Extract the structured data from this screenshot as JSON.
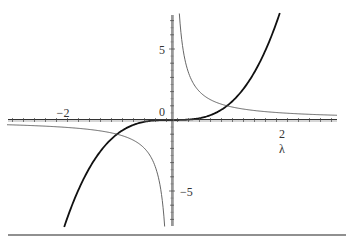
{
  "chart_data": {
    "type": "line",
    "title": "",
    "xlabel": "λ",
    "ylabel": "",
    "xlim": [
      -3.0,
      3.0
    ],
    "ylim": [
      -7.5,
      7.5
    ],
    "grid": false,
    "legend": null,
    "x_ticks": [
      {
        "value": -2,
        "label": "−2"
      },
      {
        "value": 2,
        "label": "2"
      }
    ],
    "y_ticks": [
      {
        "value": 5,
        "label": "5"
      },
      {
        "value": 0,
        "label": "0"
      },
      {
        "value": -5,
        "label": "−5"
      }
    ],
    "series": [
      {
        "name": "λ^3",
        "style": "thick",
        "color": "#111111",
        "x": [
          -1.96,
          -1.5,
          -1.0,
          -0.5,
          0,
          0.5,
          1.0,
          1.5,
          1.96
        ],
        "values": [
          -7.5,
          -3.375,
          -1.0,
          -0.125,
          0,
          0.125,
          1.0,
          3.375,
          7.5
        ]
      },
      {
        "name": "1/λ",
        "style": "thin",
        "color": "#555555",
        "x": [
          -3.0,
          -2.0,
          -1.0,
          -0.5,
          -0.134,
          0.134,
          0.5,
          1.0,
          2.0,
          3.0
        ],
        "values": [
          -0.333,
          -0.5,
          -1.0,
          -2.0,
          -7.5,
          7.5,
          2.0,
          1.0,
          0.5,
          0.333
        ]
      }
    ]
  },
  "labels": {
    "x_axis": "λ",
    "tick_neg2": "−2",
    "tick_2": "2",
    "tick_5": "5",
    "tick_0": "0",
    "tick_neg5": "−5"
  }
}
